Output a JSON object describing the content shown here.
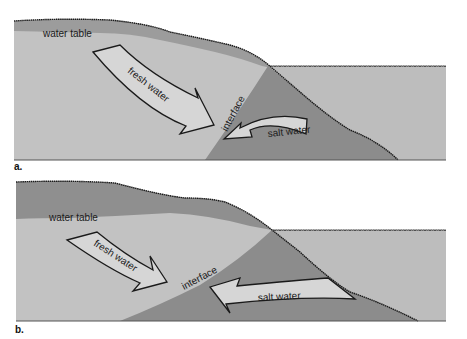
{
  "colors": {
    "background": "#ffffff",
    "unsaturated_zone": "#9a9a9a",
    "fresh_water": "#c2c2c2",
    "salt_water_ground": "#8c8c8c",
    "sea": "#bdbdbd",
    "arrow_fill": "#d6d6d6",
    "outline": "#1a1a1a"
  },
  "panels": [
    {
      "letter": "a.",
      "labels": {
        "water_table": "water table",
        "fresh_water": "fresh water",
        "interface": "interface",
        "salt_water": "salt water"
      }
    },
    {
      "letter": "b.",
      "labels": {
        "water_table": "water table",
        "fresh_water": "fresh water",
        "interface": "interface",
        "salt_water": "salt water"
      }
    }
  ]
}
